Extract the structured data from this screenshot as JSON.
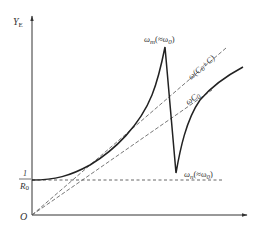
{
  "figure": {
    "type": "admittance-frequency diagram",
    "y_axis_label": "Y",
    "y_axis_subscript": "E",
    "origin_label": "O",
    "y_intercept_label_numerator": "1",
    "y_intercept_label_denominator": "R",
    "y_intercept_label_denominator_subscript": "0",
    "peak_label": {
      "main": "ω",
      "sub": "m",
      "note": "(≈ω",
      "note_sub": "0",
      "close": ")"
    },
    "dip_label": {
      "main": "ω",
      "sub": "n",
      "note": "(≈ω",
      "note_sub": "0",
      "close": ")"
    },
    "line1_label": {
      "main": "ω(C",
      "sub": "0",
      "rest": "+C)"
    },
    "line2_label": {
      "main": "ωC",
      "sub": "0"
    }
  },
  "colors": {
    "axis": "#333333",
    "curve": "#222222",
    "dashed": "#555555",
    "text": "#333333"
  }
}
